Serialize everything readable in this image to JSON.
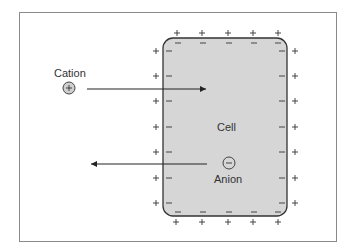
{
  "diagram": {
    "cell_label": "Cell",
    "cation_label": "Cation",
    "anion_label": "Anion",
    "cation_symbol": "+",
    "anion_symbol": "−",
    "outside_charge": "+",
    "inside_charge": "−",
    "cation_arrow": "outside-to-inside",
    "anion_arrow": "inside-to-outside",
    "colors": {
      "cell_fill": "#d6d6d6",
      "cell_border": "#333333",
      "frame_border": "#8a8a8a",
      "ion_fill": "#cfcfcf"
    }
  }
}
